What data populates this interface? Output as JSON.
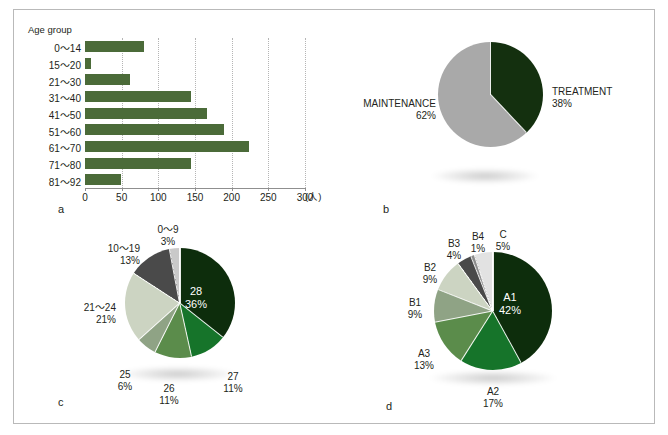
{
  "figure": {
    "width": 668,
    "height": 435,
    "background": "#ffffff",
    "border_color": "#b9b9b9"
  },
  "panels": {
    "a": {
      "letter": "a"
    },
    "b": {
      "letter": "b"
    },
    "c": {
      "letter": "c"
    },
    "d": {
      "letter": "d"
    }
  },
  "chart_data": [
    {
      "id": "a",
      "type": "bar",
      "orientation": "horizontal",
      "title": "",
      "ylabel": "Age group",
      "xlabel": "(人)",
      "xlim": [
        0,
        300
      ],
      "xticks": [
        0,
        50,
        100,
        150,
        200,
        250,
        300
      ],
      "xtick_labels": [
        "0",
        "50",
        "100",
        "150",
        "200",
        "250",
        "300"
      ],
      "grid": true,
      "bar_color": "#4b6b39",
      "categories": [
        "0〜14",
        "15〜20",
        "21〜30",
        "31〜40",
        "41〜50",
        "51〜60",
        "61〜70",
        "71〜80",
        "81〜92"
      ],
      "values": [
        80,
        8,
        62,
        145,
        167,
        190,
        223,
        144,
        49
      ]
    },
    {
      "id": "b",
      "type": "pie",
      "title": "",
      "start_angle_deg": 0,
      "direction": "clockwise",
      "labels": [
        "TREATMENT",
        "MAINTENANCE"
      ],
      "values": [
        38,
        62
      ],
      "value_labels": [
        "38%",
        "62%"
      ],
      "colors": [
        "#14300f",
        "#a9a9a9"
      ]
    },
    {
      "id": "c",
      "type": "pie",
      "title": "",
      "start_angle_deg": 0,
      "direction": "clockwise",
      "labels": [
        "28",
        "27",
        "26",
        "25",
        "21〜24",
        "10〜19",
        "0〜9"
      ],
      "values": [
        36,
        11,
        11,
        6,
        21,
        13,
        3
      ],
      "value_labels": [
        "36%",
        "11%",
        "11%",
        "6%",
        "21%",
        "13%",
        "3%"
      ],
      "colors": [
        "#0d2d0c",
        "#16742a",
        "#5b8c4b",
        "#8fa385",
        "#ccd4c2",
        "#4a4a4a",
        "#c9c9c9"
      ]
    },
    {
      "id": "d",
      "type": "pie",
      "title": "",
      "start_angle_deg": 0,
      "direction": "clockwise",
      "labels": [
        "A1",
        "A2",
        "A3",
        "B1",
        "B2",
        "B3",
        "B4",
        "C"
      ],
      "values": [
        42,
        17,
        13,
        9,
        9,
        4,
        1,
        5
      ],
      "value_labels": [
        "42%",
        "17%",
        "13%",
        "9%",
        "9%",
        "4%",
        "1%",
        "5%"
      ],
      "colors": [
        "#0d2d0c",
        "#16742a",
        "#5b8c4b",
        "#8fa385",
        "#ccd4c2",
        "#4a4a4a",
        "#8c8c8c",
        "#e2e2e2"
      ]
    }
  ],
  "panel_a": {
    "axis_title": "Age group",
    "unit": "(人)",
    "categories": [
      {
        "label": "0〜14",
        "value": 80
      },
      {
        "label": "15〜20",
        "value": 8
      },
      {
        "label": "21〜30",
        "value": 62
      },
      {
        "label": "31〜40",
        "value": 145
      },
      {
        "label": "41〜50",
        "value": 167
      },
      {
        "label": "51〜60",
        "value": 190
      },
      {
        "label": "61〜70",
        "value": 223
      },
      {
        "label": "71〜80",
        "value": 144
      },
      {
        "label": "81〜92",
        "value": 49
      }
    ],
    "xticks": [
      "0",
      "50",
      "100",
      "150",
      "200",
      "250",
      "300"
    ]
  },
  "panel_b": {
    "slices": [
      {
        "name": "TREATMENT",
        "pct": "38%",
        "value": 38,
        "color": "#14300f"
      },
      {
        "name": "MAINTENANCE",
        "pct": "62%",
        "value": 62,
        "color": "#a9a9a9"
      }
    ]
  },
  "panel_c": {
    "slices": [
      {
        "name": "28",
        "pct": "36%",
        "value": 36,
        "color": "#0d2d0c"
      },
      {
        "name": "27",
        "pct": "11%",
        "value": 11,
        "color": "#16742a"
      },
      {
        "name": "26",
        "pct": "11%",
        "value": 11,
        "color": "#5b8c4b"
      },
      {
        "name": "25",
        "pct": "6%",
        "value": 6,
        "color": "#8fa385"
      },
      {
        "name": "21〜24",
        "pct": "21%",
        "value": 21,
        "color": "#ccd4c2"
      },
      {
        "name": "10〜19",
        "pct": "13%",
        "value": 13,
        "color": "#4a4a4a"
      },
      {
        "name": "0〜9",
        "pct": "3%",
        "value": 3,
        "color": "#c9c9c9"
      }
    ]
  },
  "panel_d": {
    "slices": [
      {
        "name": "A1",
        "pct": "42%",
        "value": 42,
        "color": "#0d2d0c"
      },
      {
        "name": "A2",
        "pct": "17%",
        "value": 17,
        "color": "#16742a"
      },
      {
        "name": "A3",
        "pct": "13%",
        "value": 13,
        "color": "#5b8c4b"
      },
      {
        "name": "B1",
        "pct": "9%",
        "value": 9,
        "color": "#8fa385"
      },
      {
        "name": "B2",
        "pct": "9%",
        "value": 9,
        "color": "#ccd4c2"
      },
      {
        "name": "B3",
        "pct": "4%",
        "value": 4,
        "color": "#4a4a4a"
      },
      {
        "name": "B4",
        "pct": "1%",
        "value": 1,
        "color": "#8c8c8c"
      },
      {
        "name": "C",
        "pct": "5%",
        "value": 5,
        "color": "#e2e2e2"
      }
    ]
  }
}
